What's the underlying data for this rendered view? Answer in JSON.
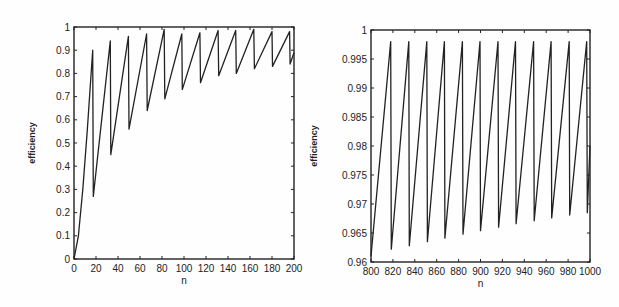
{
  "chart_data": [
    {
      "type": "line",
      "title": "",
      "xlabel": "n",
      "ylabel": "efficiency",
      "xlim": [
        0,
        200
      ],
      "ylim": [
        0,
        1
      ],
      "grid": false,
      "legend": null,
      "xticks": [
        0,
        20,
        40,
        60,
        80,
        100,
        120,
        140,
        160,
        180,
        200
      ],
      "xtick_labels": [
        "0",
        "20",
        "40",
        "60",
        "80",
        "100",
        "120",
        "140",
        "160",
        "180",
        "200"
      ],
      "yticks": [
        0,
        0.1,
        0.2,
        0.3,
        0.4,
        0.5,
        0.6,
        0.7,
        0.8,
        0.9,
        1
      ],
      "ytick_labels": [
        "0",
        "0.1",
        "0.2",
        "0.3",
        "0.4",
        "0.5",
        "0.6",
        "0.7",
        "0.8",
        "0.9",
        "1"
      ],
      "series": [
        {
          "name": "efficiency",
          "x": [
            0,
            4,
            8,
            12,
            17,
            17.5,
            33,
            33.5,
            49.5,
            50,
            66,
            66.5,
            82,
            82.5,
            98,
            98.5,
            114.5,
            115,
            131,
            131.5,
            147,
            147.5,
            163.5,
            164,
            180,
            180.5,
            196,
            196.5,
            200
          ],
          "y": [
            0,
            0.1,
            0.3,
            0.55,
            0.9,
            0.27,
            0.94,
            0.45,
            0.96,
            0.56,
            0.97,
            0.64,
            0.99,
            0.69,
            0.97,
            0.73,
            0.975,
            0.76,
            0.985,
            0.79,
            0.985,
            0.8,
            0.99,
            0.82,
            0.98,
            0.83,
            0.98,
            0.84,
            0.89
          ]
        }
      ]
    },
    {
      "type": "line",
      "title": "",
      "xlabel": "n",
      "ylabel": "efficiency",
      "xlim": [
        800,
        1000
      ],
      "ylim": [
        0.96,
        1
      ],
      "grid": false,
      "legend": null,
      "xticks": [
        800,
        820,
        840,
        860,
        880,
        900,
        920,
        940,
        960,
        980,
        1000
      ],
      "xtick_labels": [
        "800",
        "820",
        "840",
        "860",
        "880",
        "900",
        "920",
        "940",
        "960",
        "980",
        "1000"
      ],
      "yticks": [
        0.96,
        0.965,
        0.97,
        0.975,
        0.98,
        0.985,
        0.99,
        0.995,
        1
      ],
      "ytick_labels": [
        "0.96",
        "0.965",
        "0.97",
        "0.975",
        "0.98",
        "0.985",
        "0.99",
        "0.995",
        "1"
      ],
      "series": [
        {
          "name": "efficiency",
          "x": [
            800,
            818,
            818.5,
            834.5,
            835,
            851,
            851.5,
            867,
            867.5,
            883.5,
            884,
            899.5,
            900,
            916,
            916.5,
            932,
            932.5,
            948.5,
            949,
            964.5,
            965,
            981,
            981.5,
            997,
            997.5,
            1000
          ],
          "y": [
            0.961,
            0.998,
            0.9622,
            0.998,
            0.9628,
            0.998,
            0.9635,
            0.998,
            0.9641,
            0.998,
            0.9648,
            0.998,
            0.9654,
            0.998,
            0.966,
            0.998,
            0.9666,
            0.998,
            0.9671,
            0.998,
            0.9676,
            0.998,
            0.9681,
            0.998,
            0.9685,
            0.98
          ]
        }
      ]
    }
  ],
  "plots": [
    {
      "box": {
        "left": 74,
        "top": 27,
        "right": 294,
        "bottom": 259
      }
    },
    {
      "box": {
        "left": 371,
        "top": 30,
        "right": 590,
        "bottom": 262
      }
    }
  ]
}
